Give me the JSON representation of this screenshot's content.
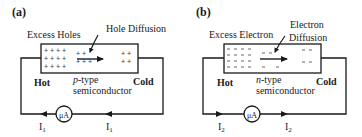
{
  "panels": [
    {
      "id": "a",
      "label": "(a)",
      "excess_label": "Excess Holes",
      "diffusion_label": "Hole Diffusion",
      "diffusion_label_line2": "",
      "hot_label": "Hot",
      "cold_label": "Cold",
      "material_type": "p",
      "material_suffix": "-type",
      "material_line2": "semiconductor",
      "carrier_symbol": "+",
      "meter_label": "μA",
      "current_label": "I",
      "current_subscript": "1",
      "current_direction": "left"
    },
    {
      "id": "b",
      "label": "(b)",
      "excess_label": "Excess Electron",
      "diffusion_label": "Electron",
      "diffusion_label_line2": "Diffusion",
      "hot_label": "Hot",
      "cold_label": "Cold",
      "material_type": "n",
      "material_suffix": "-type",
      "material_line2": "semiconductor",
      "carrier_symbol": "–",
      "meter_label": "μA",
      "current_label": "I",
      "current_subscript": "2",
      "current_direction": "right"
    }
  ],
  "colors": {
    "line": "#1a1a1a",
    "text": "#1a1a1a",
    "background": "#ffffff"
  }
}
